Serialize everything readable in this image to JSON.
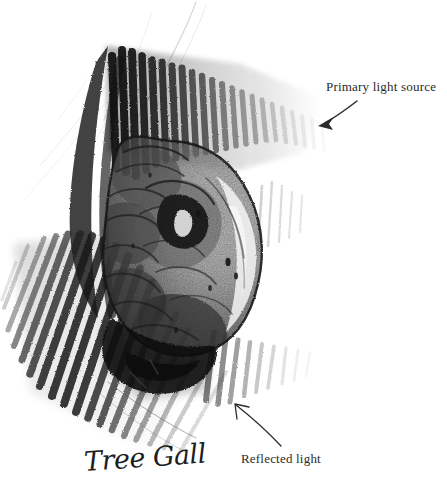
{
  "artwork": {
    "title": "Tree Gall",
    "subject": "tree gall",
    "medium": "graphite pencil drawing",
    "signature_caption": "Tree Gall",
    "background_color": "#ffffff",
    "ink_color": "#2b2b2b",
    "graphite_dark": "#1a1a1a",
    "graphite_mid": "#5a5a5a",
    "graphite_light": "#9a9a9a"
  },
  "annotations": [
    {
      "id": "primary-light-source",
      "label": "Primary light source",
      "arrow_from": {
        "x": 357,
        "y": 101
      },
      "arrow_to": {
        "x": 318,
        "y": 125
      },
      "direction": "down-left",
      "arrowhead": "solid"
    },
    {
      "id": "reflected-light",
      "label": "Reflected light",
      "arrow_from": {
        "x": 281,
        "y": 446
      },
      "arrow_to": {
        "x": 235,
        "y": 404
      },
      "direction": "up-left",
      "arrowhead": "open"
    }
  ],
  "canvas": {
    "width": 447,
    "height": 500
  }
}
